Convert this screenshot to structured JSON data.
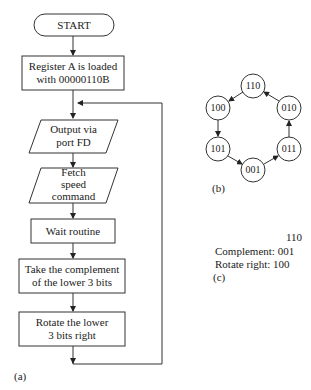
{
  "flowchart": {
    "start": "START",
    "load": [
      "Register A is loaded",
      "with 00000110B"
    ],
    "output": [
      "Output via",
      "port FD"
    ],
    "fetch": [
      "Fetch",
      "speed",
      "command"
    ],
    "wait": "Wait routine",
    "complement": [
      "Take the complement",
      "of the lower 3 bits"
    ],
    "rotate": [
      "Rotate the lower",
      "3 bits right"
    ],
    "caption": "(a)"
  },
  "state_diagram": {
    "nodes": [
      "110",
      "010",
      "011",
      "001",
      "101",
      "100"
    ],
    "caption": "(b)"
  },
  "example": {
    "value": "110",
    "complement_label": "Complement:",
    "complement_value": "001",
    "rotate_label": "Rotate right:",
    "rotate_value": "100",
    "caption": "(c)"
  }
}
